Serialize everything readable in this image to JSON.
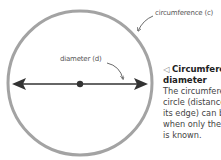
{
  "diagram": {
    "labels": {
      "circumference": "circumference (c)",
      "diameter": "diameter (d)"
    },
    "caption": {
      "marker": "◁",
      "title_line1": "Circumference and",
      "title_line2": "diameter",
      "body_lines": [
        "The circumference of a",
        "circle (distance around",
        "its edge) can be found",
        "when only the diameter",
        "is known."
      ]
    },
    "colors": {
      "circle_stroke": "#a3a3a3",
      "diameter_line": "#333333",
      "arrow_pointer": "#6a6a6a"
    }
  }
}
